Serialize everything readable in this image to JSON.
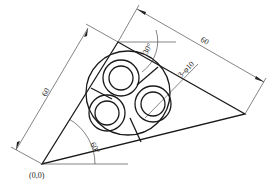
{
  "drawing": {
    "type": "technical-drawing",
    "labels": {
      "origin": "(0,0)",
      "dim_left": "60",
      "dim_right": "60",
      "angle_bottom": "60°",
      "angle_top": "30°",
      "holes": "3-φ10"
    }
  },
  "geometry": {
    "origin_px": [
      42,
      164
    ],
    "top_vertex_px": [
      118,
      42
    ],
    "right_vertex_px": [
      245,
      114
    ],
    "big_circle": {
      "cx": 128,
      "cy": 93,
      "r": 42
    },
    "small_circles": [
      {
        "cx": 121,
        "cy": 78,
        "r_outer": 18,
        "r_inner": 12
      },
      {
        "cx": 107,
        "cy": 113,
        "r_outer": 18,
        "r_inner": 12
      },
      {
        "cx": 153,
        "cy": 104,
        "r_outer": 18,
        "r_inner": 12
      }
    ],
    "line_color": "#1a1a1a"
  }
}
